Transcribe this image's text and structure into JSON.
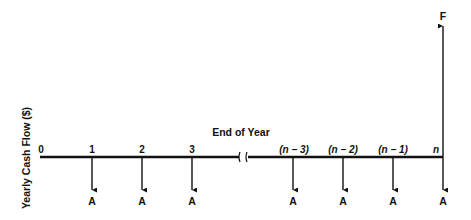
{
  "diagram": {
    "y_axis_label": "Yearly Cash Flow ($)",
    "x_axis_label": "End of Year",
    "time_labels": [
      "0",
      "1",
      "2",
      "3",
      "(n − 3)",
      "(n − 2)",
      "(n − 1)",
      "n"
    ],
    "payment_label": "A",
    "future_value_label": "F",
    "payments": [
      {
        "period": "1",
        "label": "A",
        "direction": "down"
      },
      {
        "period": "2",
        "label": "A",
        "direction": "down"
      },
      {
        "period": "3",
        "label": "A",
        "direction": "down"
      },
      {
        "period": "(n − 3)",
        "label": "A",
        "direction": "down"
      },
      {
        "period": "(n − 2)",
        "label": "A",
        "direction": "down"
      },
      {
        "period": "(n − 1)",
        "label": "A",
        "direction": "down"
      },
      {
        "period": "n",
        "label": "A",
        "direction": "down"
      }
    ],
    "future_value": {
      "period": "n",
      "label": "F",
      "direction": "up"
    },
    "axis_break": "between 3 and (n − 3)",
    "colors": {
      "line": "#111111",
      "background": "#ffffff"
    }
  }
}
